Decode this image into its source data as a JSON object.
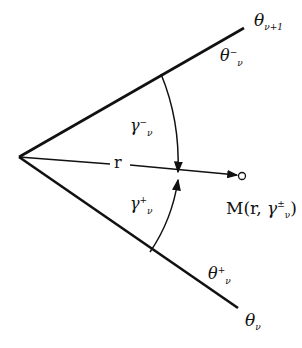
{
  "diagram": {
    "type": "angular-sector",
    "vertex": {
      "x": 19,
      "y": 157
    },
    "rays": [
      {
        "id": "upper",
        "end": {
          "x": 244,
          "y": 28
        },
        "label": "θ",
        "label_sub": "ν+1"
      },
      {
        "id": "lower",
        "end": {
          "x": 238,
          "y": 308
        },
        "label": "θ",
        "label_sub": "ν"
      }
    ],
    "region_labels": {
      "theta_minus": {
        "base": "θ",
        "sub": "ν",
        "sup": "−"
      },
      "theta_plus": {
        "base": "θ",
        "sub": "ν",
        "sup": "+"
      },
      "gamma_minus": {
        "base": "γ",
        "sub": "ν",
        "sup": "−"
      },
      "gamma_plus": {
        "base": "γ",
        "sub": "ν",
        "sup": "+"
      }
    },
    "radius_label": "r",
    "point": {
      "label_prefix": "M(r, ",
      "base": "γ",
      "sub": "ν",
      "sup": "±",
      "label_suffix": ")"
    },
    "colors": {
      "stroke": "#111111",
      "background": "#ffffff"
    }
  }
}
